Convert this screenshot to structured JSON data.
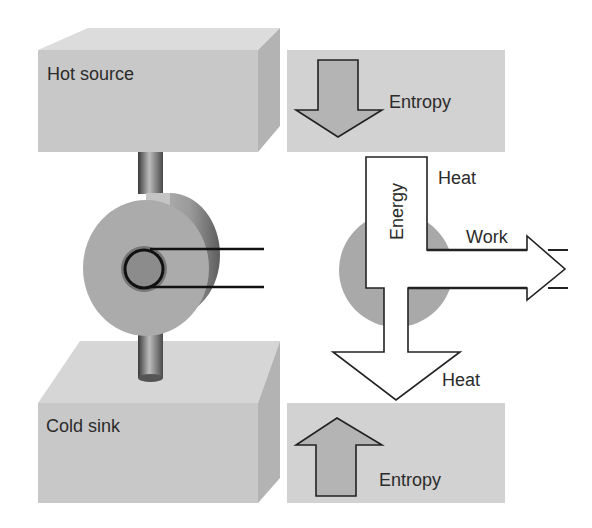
{
  "diagram": {
    "labels": {
      "hot_source": "Hot source",
      "cold_sink": "Cold sink",
      "entropy_in": "Entropy",
      "entropy_out": "Entropy",
      "energy": "Energy",
      "heat_in": "Heat",
      "work": "Work",
      "heat_out": "Heat"
    },
    "colors": {
      "reservoir_front": "#c8c8c8",
      "reservoir_top": "#dcdcdc",
      "reservoir_side": "#b0b0b0",
      "panel": "#d2d2d2",
      "entropy_arrow": "#b4b4b4",
      "engine_disc": "#ababab",
      "engine_core": "#7a7a7a",
      "energy_arrow": "#ffffff",
      "outline": "#222222"
    }
  }
}
